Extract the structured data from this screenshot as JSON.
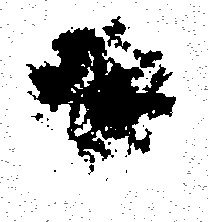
{
  "image": {
    "kind": "binarized-micrograph",
    "title": "Binarized cell micrograph",
    "description": "High-contrast black-and-white thresholded micrograph of a single rounded cell with a dense dark nucleus, granular lobed cytoplasm and scattered scanner noise on a white field.",
    "width": 208,
    "height": 222,
    "bit_depth": "1-bit (thresholded)",
    "background_color": "#ffffff",
    "foreground_color": "#000000",
    "has_text_labels": false,
    "has_scale_bar": false,
    "has_axes": false,
    "has_border": false
  },
  "render": {
    "seed": 20240517,
    "threshold": 0.5,
    "supersample": 1
  },
  "structures": {
    "nucleus": {
      "label": "nucleus",
      "shape": "ellipse",
      "center_x": 117,
      "center_y": 104,
      "radius_x": 19,
      "radius_y": 21,
      "fill": "#000000",
      "solid": true,
      "edge_softness": 1.6
    },
    "cell_body": {
      "label": "cell-body",
      "shape": "lobed-blob",
      "center_x": 101,
      "center_y": 103,
      "radius_x": 84,
      "radius_y": 93,
      "bounds": {
        "left": 18,
        "top": 14,
        "right": 185,
        "bottom": 200
      },
      "lobe_count": 9,
      "lobe_amplitude": 0.12,
      "lobe_phase": 0.7
    },
    "density_field": {
      "label": "cytoplasm-density",
      "top_density": 0.82,
      "middle_density": 0.66,
      "bottom_density": 0.4,
      "edge_falloff": 2.1,
      "grain_scale_coarse": 9.0,
      "grain_scale_fine": 3.4,
      "grain_weight_coarse": 0.62,
      "grain_weight_fine": 0.38
    },
    "dark_patches": [
      {
        "label": "upper-left-lobe",
        "cx": 72,
        "cy": 46,
        "rx": 30,
        "ry": 22,
        "strength": 0.4
      },
      {
        "label": "upper-mid-lobe",
        "cx": 104,
        "cy": 34,
        "rx": 26,
        "ry": 17,
        "strength": 0.34
      },
      {
        "label": "left-lobe",
        "cx": 40,
        "cy": 88,
        "rx": 24,
        "ry": 28,
        "strength": 0.44
      },
      {
        "label": "left-mid-lobe",
        "cx": 62,
        "cy": 72,
        "rx": 22,
        "ry": 20,
        "strength": 0.3
      },
      {
        "label": "right-lobe",
        "cx": 160,
        "cy": 96,
        "rx": 21,
        "ry": 24,
        "strength": 0.38
      },
      {
        "label": "upper-right-lobe",
        "cx": 150,
        "cy": 52,
        "rx": 20,
        "ry": 18,
        "strength": 0.24
      },
      {
        "label": "nucleus-halo",
        "cx": 117,
        "cy": 104,
        "rx": 34,
        "ry": 34,
        "strength": 0.3
      },
      {
        "label": "lower-right-lobe",
        "cx": 146,
        "cy": 140,
        "rx": 20,
        "ry": 18,
        "strength": 0.26
      },
      {
        "label": "lower-mid-mass",
        "cx": 96,
        "cy": 150,
        "rx": 26,
        "ry": 20,
        "strength": 0.16
      }
    ],
    "light_pockets": [
      {
        "label": "vacuole-upper-right",
        "cx": 155,
        "cy": 46,
        "rx": 6,
        "ry": 6,
        "strength": 0.52
      },
      {
        "label": "vacuole-right",
        "cx": 168,
        "cy": 62,
        "rx": 5,
        "ry": 5,
        "strength": 0.44
      },
      {
        "label": "vacuole-lower-right",
        "cx": 141,
        "cy": 135,
        "rx": 7,
        "ry": 6,
        "strength": 0.6
      },
      {
        "label": "vacuole-mid-left",
        "cx": 66,
        "cy": 108,
        "rx": 6,
        "ry": 5,
        "strength": 0.4
      },
      {
        "label": "vacuole-upper-left",
        "cx": 58,
        "cy": 60,
        "rx": 5,
        "ry": 5,
        "strength": 0.36
      },
      {
        "label": "vacuole-lower-left",
        "cx": 78,
        "cy": 132,
        "rx": 6,
        "ry": 5,
        "strength": 0.42
      },
      {
        "label": "vacuole-top",
        "cx": 118,
        "cy": 58,
        "rx": 5,
        "ry": 4,
        "strength": 0.3
      },
      {
        "label": "cleft-below-nucleus",
        "cx": 112,
        "cy": 128,
        "rx": 9,
        "ry": 5,
        "strength": 0.34
      }
    ],
    "tail": {
      "label": "lower-tail",
      "cx": 96,
      "cy": 184,
      "rx": 18,
      "ry": 18,
      "density": 0.3
    },
    "noise_specks": {
      "label": "scanner-noise",
      "count": 320,
      "size_min": 1,
      "size_max": 2,
      "opacity": 0.55,
      "exclusion_margin": 6,
      "regions": [
        {
          "label": "top-band",
          "x": 0,
          "y": 0,
          "w": 208,
          "h": 34,
          "weight": 0.26
        },
        {
          "label": "bottom-band",
          "x": 0,
          "y": 186,
          "w": 208,
          "h": 36,
          "weight": 0.34
        },
        {
          "label": "right-column",
          "x": 182,
          "y": 34,
          "w": 26,
          "h": 156,
          "weight": 0.28
        },
        {
          "label": "left-column",
          "x": 0,
          "y": 34,
          "w": 20,
          "h": 156,
          "weight": 0.12
        }
      ]
    }
  }
}
